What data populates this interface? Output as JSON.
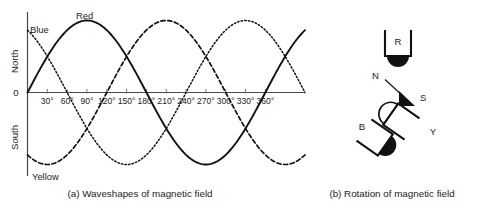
{
  "figure": {
    "background_color": "#ffffff",
    "ink_color": "#111111"
  },
  "panels": [
    {
      "id": "panel-a",
      "caption": "(a) Waveshapes of magnetic field"
    },
    {
      "id": "panel-b",
      "caption": "(b) Rotation of magnetic field"
    }
  ],
  "chart_data": {
    "type": "line",
    "title": "(a) Waveshapes of magnetic field",
    "xlabel": "",
    "ylabel": "",
    "grid": false,
    "legend_position": "inline-annotations",
    "xlim": [
      0,
      420
    ],
    "ylim": [
      -1.15,
      1.15
    ],
    "xticks": [
      30,
      60,
      90,
      120,
      150,
      180,
      210,
      240,
      270,
      300,
      330,
      360
    ],
    "xtick_labels": [
      "30°",
      "60°",
      "90°",
      "120°",
      "150°",
      "180°",
      "210°",
      "240°",
      "270°",
      "300°",
      "330°",
      "360°"
    ],
    "ytick_labels": [
      "North",
      "0",
      "South"
    ],
    "y_axis_top_label": "North",
    "y_axis_origin_label": "0",
    "y_axis_bottom_label": "South",
    "x": [
      0,
      15,
      30,
      45,
      60,
      75,
      90,
      105,
      120,
      135,
      150,
      165,
      180,
      195,
      210,
      225,
      240,
      255,
      270,
      285,
      300,
      315,
      330,
      345,
      360,
      375,
      390,
      405,
      420
    ],
    "series": [
      {
        "name": "Red",
        "label": "Red",
        "style": "solid",
        "phase_deg": 0,
        "label_at_deg": 90,
        "values": [
          0.0,
          0.259,
          0.5,
          0.707,
          0.866,
          0.966,
          1.0,
          0.966,
          0.866,
          0.707,
          0.5,
          0.259,
          0.0,
          -0.259,
          -0.5,
          -0.707,
          -0.866,
          -0.966,
          -1.0,
          -0.966,
          -0.866,
          -0.707,
          -0.5,
          -0.259,
          0.0,
          0.259,
          0.5,
          0.707,
          0.866
        ]
      },
      {
        "name": "Yellow",
        "label": "Yellow",
        "style": "dashed",
        "phase_deg": -120,
        "label_at_deg": 30,
        "values": [
          -0.866,
          -0.966,
          -1.0,
          -0.966,
          -0.866,
          -0.707,
          -0.5,
          -0.259,
          0.0,
          0.259,
          0.5,
          0.707,
          0.866,
          0.966,
          1.0,
          0.966,
          0.866,
          0.707,
          0.5,
          0.259,
          0.0,
          -0.259,
          -0.5,
          -0.707,
          -0.866,
          -0.966,
          -1.0,
          -0.966,
          -0.866
        ]
      },
      {
        "name": "Blue",
        "label": "Blue",
        "style": "dotted",
        "phase_deg": 120,
        "label_at_deg": 5,
        "values": [
          0.866,
          0.707,
          0.5,
          0.259,
          0.0,
          -0.259,
          -0.5,
          -0.707,
          -0.866,
          -0.966,
          -1.0,
          -0.966,
          -0.866,
          -0.707,
          -0.5,
          -0.259,
          0.0,
          0.259,
          0.5,
          0.707,
          0.866,
          0.966,
          1.0,
          0.966,
          0.866,
          0.707,
          0.5,
          0.259,
          0.0
        ]
      }
    ]
  },
  "rotation_diagram": {
    "caption": "(b) Rotation of magnetic field",
    "coils": [
      {
        "id": "coil-r",
        "label": "R",
        "pole_fill": "filled",
        "rotation_deg": 0
      },
      {
        "id": "coil-b",
        "label": "B",
        "pole_fill": "filled",
        "rotation_deg": -55
      },
      {
        "id": "coil-y",
        "label": "Y",
        "pole_fill": "open",
        "rotation_deg": 125
      }
    ],
    "field_vector": {
      "tail_label": "N",
      "head_label": "S"
    }
  }
}
